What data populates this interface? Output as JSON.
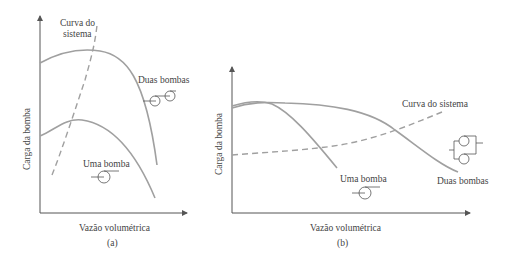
{
  "figure_a": {
    "caption": "(a)",
    "ylabel": "Carga da bomba",
    "xlabel": "Vazão volumétrica",
    "system_curve_label_line1": "Curva do",
    "system_curve_label_line2": "sistema",
    "two_pumps_label": "Duas bombas",
    "one_pump_label": "Uma bomba",
    "configuration": "series"
  },
  "figure_b": {
    "caption": "(b)",
    "ylabel": "Carga da bomba",
    "xlabel": "Vazão volumétrica",
    "system_curve_label": "Curva do sistema",
    "two_pumps_label": "Duas bombas",
    "one_pump_label": "Uma bomba",
    "configuration": "parallel"
  },
  "colors": {
    "curve": "#a0a0a0",
    "axis": "#555555",
    "text": "#444444"
  }
}
